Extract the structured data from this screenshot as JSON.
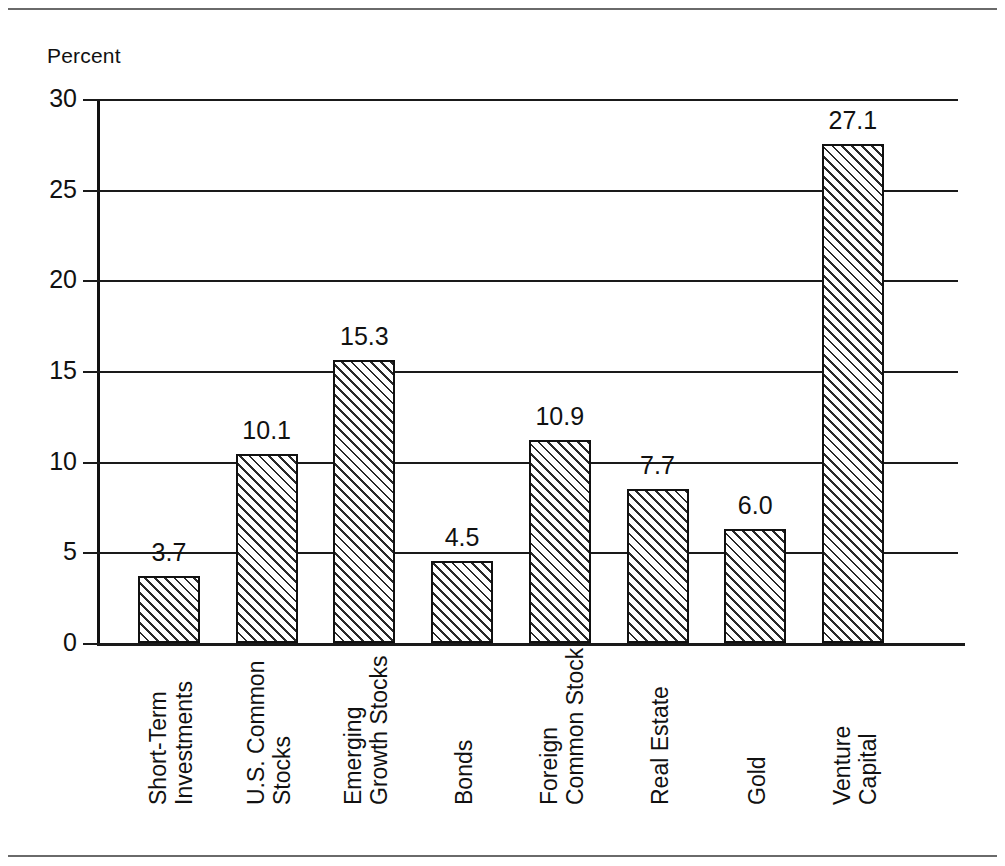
{
  "page": {
    "rules": [
      "top-rule",
      "bottom-rule"
    ],
    "background_color": "#ffffff",
    "ink_color": "#111111"
  },
  "chart_data": {
    "type": "bar",
    "title": "",
    "subtitle": "",
    "xlabel": "",
    "ylabel": "Percent",
    "ylim": [
      0,
      30
    ],
    "ytick_values": [
      0,
      5,
      10,
      15,
      20,
      25,
      30
    ],
    "ytick_labels": [
      "0",
      "5",
      "10",
      "15",
      "20",
      "25",
      "30"
    ],
    "grid": true,
    "grid_axis": "y",
    "legend": false,
    "legend_position": "none",
    "bar_style": "diagonal-hatch",
    "bar_fill_color": "#ffffff",
    "bar_edge_color": "#111111",
    "value_label_format": "one-decimal",
    "categories": [
      "Short-Term Investments",
      "U.S. Common Stocks",
      "Emerging Growth Stocks",
      "Bonds",
      "Foreign Common Stock",
      "Real Estate",
      "Gold",
      "Venture Capital"
    ],
    "category_label_lines": [
      [
        "Short-Term",
        "Investments"
      ],
      [
        "U.S. Common",
        "Stocks"
      ],
      [
        "Emerging",
        "Growth Stocks"
      ],
      [
        "Bonds"
      ],
      [
        "Foreign",
        "Common Stock"
      ],
      [
        "Real Estate"
      ],
      [
        "Gold"
      ],
      [
        "Venture",
        "Capital"
      ]
    ],
    "values": [
      3.7,
      10.1,
      15.3,
      4.5,
      10.9,
      7.7,
      6.0,
      27.1
    ],
    "value_labels": [
      "3.7",
      "10.1",
      "15.3",
      "4.5",
      "10.9",
      "7.7",
      "6.0",
      "27.1"
    ],
    "bar_drawn_tops": [
      3.7,
      10.4,
      15.6,
      4.5,
      11.2,
      8.5,
      6.3,
      27.5
    ]
  }
}
